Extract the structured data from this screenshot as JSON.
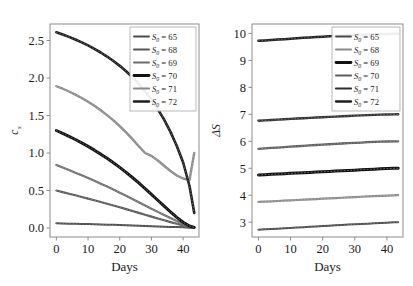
{
  "figure": {
    "panels": [
      "left",
      "right"
    ]
  },
  "chart_data": [
    {
      "type": "line",
      "panel": "left",
      "title": "",
      "xlabel": "Days",
      "ylabel": "c",
      "ylabel_sub": "s",
      "xlim": [
        -2,
        45
      ],
      "ylim": [
        -0.12,
        2.72
      ],
      "xticks": [
        0,
        10,
        20,
        30,
        40
      ],
      "xticklabels": [
        "0",
        "10",
        "20",
        "30",
        "40"
      ],
      "yticks": [
        0.0,
        0.5,
        1.0,
        1.5,
        2.0,
        2.5
      ],
      "yticklabels": [
        "0.0",
        "0.5",
        "1.0",
        "1.5",
        "2.0",
        "2.5"
      ],
      "grid": false,
      "legend_position": "upper right",
      "x": [
        0,
        2,
        4,
        6,
        8,
        10,
        12,
        14,
        16,
        18,
        20,
        22,
        24,
        26,
        28,
        30,
        32,
        34,
        36,
        38,
        40,
        42,
        43.5
      ],
      "series": [
        {
          "name": "S0 = 65",
          "label": "S",
          "label_sub": "0",
          "label_rest": " = 65",
          "color": "#4a4a4a",
          "width": 2.0,
          "values": [
            0.062,
            0.06,
            0.058,
            0.056,
            0.054,
            0.052,
            0.05,
            0.048,
            0.045,
            0.042,
            0.039,
            0.036,
            0.033,
            0.03,
            0.027,
            0.024,
            0.021,
            0.018,
            0.015,
            0.012,
            0.009,
            0.005,
            0.002
          ]
        },
        {
          "name": "S0 = 68",
          "label": "S",
          "label_sub": "0",
          "label_rest": " = 68",
          "color": "#575757",
          "width": 2.2,
          "values": [
            0.5,
            0.479,
            0.457,
            0.436,
            0.414,
            0.392,
            0.37,
            0.347,
            0.324,
            0.3,
            0.276,
            0.252,
            0.227,
            0.202,
            0.177,
            0.152,
            0.127,
            0.103,
            0.079,
            0.056,
            0.034,
            0.013,
            0.004
          ]
        },
        {
          "name": "S0 = 69",
          "label": "S",
          "label_sub": "0",
          "label_rest": " = 69",
          "color": "#6d6d6d",
          "width": 2.2,
          "values": [
            0.84,
            0.806,
            0.772,
            0.737,
            0.702,
            0.666,
            0.629,
            0.591,
            0.552,
            0.512,
            0.471,
            0.429,
            0.387,
            0.344,
            0.301,
            0.258,
            0.215,
            0.173,
            0.132,
            0.092,
            0.055,
            0.021,
            0.006
          ]
        },
        {
          "name": "S0 = 70",
          "label": "S",
          "label_sub": "0",
          "label_rest": " = 70",
          "color": "#111111",
          "width": 3.0,
          "values": [
            1.3,
            1.262,
            1.222,
            1.18,
            1.135,
            1.088,
            1.038,
            0.985,
            0.929,
            0.87,
            0.808,
            0.742,
            0.673,
            0.601,
            0.526,
            0.449,
            0.37,
            0.291,
            0.214,
            0.141,
            0.076,
            0.026,
            0.008
          ]
        },
        {
          "name": "S0 = 71",
          "label": "S",
          "label_sub": "0",
          "label_rest": " = 71",
          "color": "#8a8a8a",
          "width": 2.4,
          "values": [
            1.89,
            1.857,
            1.82,
            1.779,
            1.734,
            1.684,
            1.63,
            1.57,
            1.505,
            1.434,
            1.357,
            1.274,
            1.185,
            1.091,
            1.0,
            0.962,
            0.9,
            0.83,
            0.76,
            0.7,
            0.66,
            0.64,
            1.0
          ]
        },
        {
          "name": "S0 = 72",
          "label": "S",
          "label_sub": "0",
          "label_rest": " = 72",
          "color": "#1c1c1c",
          "width": 2.6,
          "values": [
            2.61,
            2.58,
            2.548,
            2.513,
            2.475,
            2.434,
            2.389,
            2.34,
            2.286,
            2.227,
            2.162,
            2.09,
            2.01,
            1.921,
            1.822,
            1.711,
            1.586,
            1.444,
            1.282,
            1.094,
            0.873,
            0.56,
            0.2
          ]
        }
      ]
    },
    {
      "type": "line",
      "panel": "right",
      "title": "",
      "xlabel": "Days",
      "ylabel": "ΔS",
      "xlim": [
        -2,
        45
      ],
      "ylim": [
        2.45,
        10.35
      ],
      "xticks": [
        0,
        10,
        20,
        30,
        40
      ],
      "xticklabels": [
        "0",
        "10",
        "20",
        "30",
        "40"
      ],
      "yticks": [
        3,
        4,
        5,
        6,
        7,
        8,
        9,
        10
      ],
      "yticklabels": [
        "3",
        "4",
        "5",
        "6",
        "7",
        "8",
        "9",
        "10"
      ],
      "grid": false,
      "legend_position": "upper right",
      "x": [
        0,
        2,
        4,
        6,
        8,
        10,
        12,
        14,
        16,
        18,
        20,
        22,
        24,
        26,
        28,
        30,
        32,
        34,
        36,
        38,
        40,
        42,
        43.5
      ],
      "series": [
        {
          "name": "S0 = 65",
          "label": "S",
          "label_sub": "0",
          "label_rest": " = 65",
          "color": "#4a4a4a",
          "width": 2.0,
          "values": [
            2.72,
            2.733,
            2.746,
            2.759,
            2.772,
            2.785,
            2.798,
            2.812,
            2.826,
            2.84,
            2.854,
            2.868,
            2.882,
            2.896,
            2.91,
            2.922,
            2.934,
            2.946,
            2.958,
            2.97,
            2.982,
            2.994,
            3.0
          ]
        },
        {
          "name": "S0 = 68",
          "label": "S",
          "label_sub": "0",
          "label_rest": " = 68",
          "color": "#8a8a8a",
          "width": 2.2,
          "values": [
            3.75,
            3.762,
            3.774,
            3.786,
            3.798,
            3.81,
            3.822,
            3.834,
            3.846,
            3.858,
            3.87,
            3.882,
            3.894,
            3.906,
            3.918,
            3.93,
            3.942,
            3.954,
            3.966,
            3.978,
            3.988,
            3.996,
            4.0
          ]
        },
        {
          "name": "S0 = 69",
          "label": "S",
          "label_sub": "0",
          "label_rest": " = 69",
          "color": "#111111",
          "width": 3.0,
          "values": [
            4.75,
            4.762,
            4.774,
            4.786,
            4.798,
            4.81,
            4.822,
            4.834,
            4.846,
            4.858,
            4.87,
            4.882,
            4.894,
            4.906,
            4.918,
            4.93,
            4.942,
            4.954,
            4.966,
            4.978,
            4.988,
            4.996,
            5.0
          ]
        },
        {
          "name": "S0 = 70",
          "label": "S",
          "label_sub": "0",
          "label_rest": " = 70",
          "color": "#5e5e5e",
          "width": 2.3,
          "values": [
            5.72,
            5.736,
            5.752,
            5.768,
            5.784,
            5.8,
            5.816,
            5.832,
            5.848,
            5.862,
            5.876,
            5.89,
            5.904,
            5.918,
            5.93,
            5.942,
            5.954,
            5.966,
            5.976,
            5.986,
            5.992,
            5.998,
            6.0
          ]
        },
        {
          "name": "S0 = 71",
          "label": "S",
          "label_sub": "0",
          "label_rest": " = 71",
          "color": "#2e2e2e",
          "width": 2.4,
          "values": [
            6.76,
            6.774,
            6.788,
            6.802,
            6.816,
            6.83,
            6.844,
            6.856,
            6.868,
            6.88,
            6.892,
            6.904,
            6.916,
            6.928,
            6.94,
            6.95,
            6.96,
            6.97,
            6.98,
            6.988,
            6.994,
            6.998,
            7.0
          ]
        },
        {
          "name": "S0 = 72",
          "label": "S",
          "label_sub": "0",
          "label_rest": " = 72",
          "color": "#1c1c1c",
          "width": 2.5,
          "values": [
            9.73,
            9.742,
            9.756,
            9.772,
            9.788,
            9.804,
            9.82,
            9.836,
            9.852,
            9.866,
            9.88,
            9.894,
            9.906,
            9.918,
            9.93,
            9.94,
            9.95,
            9.958,
            9.966,
            9.974,
            9.98,
            9.986,
            9.99
          ]
        }
      ]
    }
  ]
}
